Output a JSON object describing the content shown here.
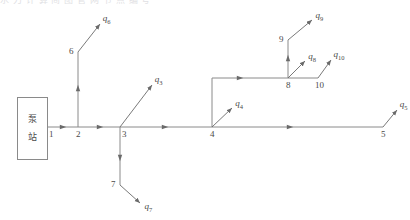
{
  "figure": {
    "kind": "pipe-network-schematic",
    "pump_station": {
      "char_top": "泵",
      "char_bottom": "站"
    },
    "top_cut_text": "水 力 计 算 简 图 管 网 节 点 编 号"
  },
  "nodes": [
    {
      "id": "n1",
      "label": "1",
      "x": 48,
      "y": 127
    },
    {
      "id": "n2",
      "label": "2",
      "x": 78,
      "y": 127
    },
    {
      "id": "n3",
      "label": "3",
      "x": 120,
      "y": 127
    },
    {
      "id": "n4",
      "label": "4",
      "x": 212,
      "y": 127
    },
    {
      "id": "n5",
      "label": "5",
      "x": 383,
      "y": 127
    },
    {
      "id": "n6",
      "label": "6",
      "x": 78,
      "y": 52
    },
    {
      "id": "n7",
      "label": "7",
      "x": 120,
      "y": 185
    },
    {
      "id": "n8",
      "label": "8",
      "x": 288,
      "y": 78
    },
    {
      "id": "n9",
      "label": "9",
      "x": 288,
      "y": 40
    },
    {
      "id": "n10",
      "label": "10",
      "x": 318,
      "y": 78
    }
  ],
  "flows": [
    {
      "id": "q3",
      "text": "q",
      "sub": "3",
      "from": [
        120,
        127
      ],
      "to": [
        152,
        85
      ]
    },
    {
      "id": "q4",
      "text": "q",
      "sub": "4",
      "from": [
        212,
        127
      ],
      "to": [
        232,
        108
      ]
    },
    {
      "id": "q5",
      "text": "q",
      "sub": "5",
      "from": [
        383,
        127
      ],
      "to": [
        397,
        110
      ]
    },
    {
      "id": "q6",
      "text": "q",
      "sub": "6",
      "from": [
        78,
        52
      ],
      "to": [
        100,
        24
      ]
    },
    {
      "id": "q7",
      "text": "q",
      "sub": "7",
      "from": [
        120,
        185
      ],
      "to": [
        140,
        203
      ]
    },
    {
      "id": "q8",
      "text": "q",
      "sub": "8",
      "from": [
        288,
        78
      ],
      "to": [
        305,
        61
      ]
    },
    {
      "id": "q9",
      "text": "q",
      "sub": "9",
      "from": [
        288,
        40
      ],
      "to": [
        312,
        20
      ]
    },
    {
      "id": "q10",
      "text": "q",
      "sub": "10",
      "from": [
        318,
        78
      ],
      "to": [
        331,
        60
      ]
    }
  ],
  "pipes": [
    {
      "id": "p12",
      "label": "1-2",
      "path": [
        [
          48,
          127
        ],
        [
          78,
          127
        ]
      ]
    },
    {
      "id": "p23",
      "label": "2-3",
      "path": [
        [
          78,
          127
        ],
        [
          120,
          127
        ]
      ]
    },
    {
      "id": "p34",
      "label": "3-4",
      "path": [
        [
          120,
          127
        ],
        [
          212,
          127
        ]
      ]
    },
    {
      "id": "p45",
      "label": "4-5",
      "path": [
        [
          212,
          127
        ],
        [
          383,
          127
        ]
      ]
    },
    {
      "id": "p26",
      "label": "2-6",
      "path": [
        [
          78,
          127
        ],
        [
          78,
          52
        ]
      ]
    },
    {
      "id": "p37",
      "label": "3-7",
      "path": [
        [
          120,
          127
        ],
        [
          120,
          185
        ]
      ]
    },
    {
      "id": "p48",
      "label": "4-8",
      "path": [
        [
          212,
          127
        ],
        [
          212,
          78
        ],
        [
          288,
          78
        ]
      ]
    },
    {
      "id": "p89",
      "label": "8-9",
      "path": [
        [
          288,
          78
        ],
        [
          288,
          40
        ]
      ]
    },
    {
      "id": "p810",
      "label": "8-10",
      "path": [
        [
          288,
          78
        ],
        [
          318,
          78
        ]
      ]
    }
  ],
  "flow_markers": [
    {
      "id": "m12",
      "x": 63,
      "y": 127,
      "dir": "right"
    },
    {
      "id": "m23",
      "x": 100,
      "y": 127,
      "dir": "right"
    },
    {
      "id": "m34",
      "x": 165,
      "y": 127,
      "dir": "right"
    },
    {
      "id": "m45",
      "x": 290,
      "y": 127,
      "dir": "right"
    },
    {
      "id": "m26",
      "x": 78,
      "y": 88,
      "dir": "up"
    },
    {
      "id": "m37",
      "x": 120,
      "y": 158,
      "dir": "down"
    },
    {
      "id": "m48",
      "x": 240,
      "y": 78,
      "dir": "right"
    },
    {
      "id": "m89",
      "x": 288,
      "y": 58,
      "dir": "up"
    }
  ],
  "colors": {
    "line": "#8a8a8a",
    "text": "#4a4a4a",
    "background": "#ffffff"
  }
}
